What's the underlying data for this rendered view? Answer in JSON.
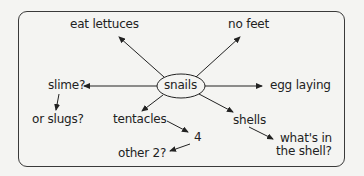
{
  "diagram": {
    "type": "mind-map",
    "center": {
      "label": "snails"
    },
    "nodes": {
      "eat_lettuces": "eat lettuces",
      "no_feet": "no feet",
      "slime": "slime?",
      "or_slugs": "or slugs?",
      "egg_laying": "egg laying",
      "tentacles": "tentacles",
      "four": "4",
      "other_two": "other 2?",
      "shells": "shells",
      "whats_in_line1": "what's in",
      "whats_in_line2": "the shell?"
    },
    "edges": [
      {
        "from": "snails",
        "to": "eat lettuces"
      },
      {
        "from": "snails",
        "to": "no feet"
      },
      {
        "from": "snails",
        "to": "slime?"
      },
      {
        "from": "slime?",
        "to": "or slugs?"
      },
      {
        "from": "snails",
        "to": "egg laying"
      },
      {
        "from": "snails",
        "to": "tentacles"
      },
      {
        "from": "tentacles",
        "to": "4"
      },
      {
        "from": "4",
        "to": "other 2?"
      },
      {
        "from": "snails",
        "to": "shells"
      },
      {
        "from": "shells",
        "to": "what's in the shell?"
      }
    ],
    "colors": {
      "ink": "#222222",
      "frame": "#3a3a3a",
      "background": "#f4f4f2"
    }
  }
}
